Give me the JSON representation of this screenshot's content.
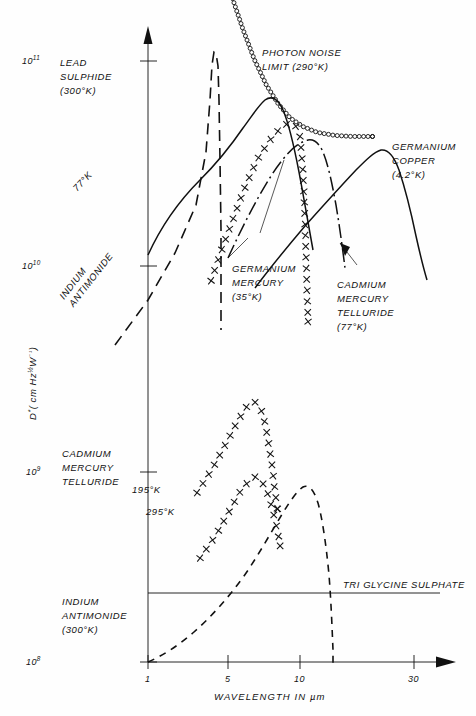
{
  "chart_data": {
    "type": "line",
    "title": "",
    "xlabel": "WAVELENGTH IN µm",
    "ylabel": "D* (cm Hz½ W⁻¹)",
    "xscale": "log",
    "yscale": "log",
    "xlim": [
      1,
      40
    ],
    "ylim": [
      100000000.0,
      200000000000.0
    ],
    "xticks": [
      "1",
      "5",
      "10",
      "30"
    ],
    "xtick_values": [
      1,
      5,
      10,
      30
    ],
    "yticks": [
      "10⁸",
      "10⁹",
      "10¹⁰",
      "10¹¹"
    ],
    "ytick_values": [
      100000000.0,
      1000000000.0,
      10000000000.0,
      100000000000.0
    ],
    "grid": false,
    "legend": "inline-annotations",
    "series": [
      {
        "name": "PHOTON NOISE LIMIT (290°K)",
        "style": "circles-chain",
        "points": [
          [
            3.6,
            205000000000.0
          ],
          [
            4.2,
            145000000000.0
          ],
          [
            5.0,
            102000000000.0
          ],
          [
            6.0,
            76000000000.0
          ],
          [
            7.2,
            61000000000.0
          ],
          [
            8.6,
            52000000000.0
          ],
          [
            10.5,
            47000000000.0
          ],
          [
            13,
            44000000000.0
          ],
          [
            17,
            42500000000.0
          ],
          [
            22,
            42000000000.0
          ],
          [
            30,
            42000000000.0
          ]
        ]
      },
      {
        "name": "LEAD SULPHIDE (300°K)",
        "style": "solid",
        "points": [
          [
            1.0,
            30000000000.0
          ],
          [
            1.3,
            44000000000.0
          ],
          [
            1.7,
            56000000000.0
          ],
          [
            2.1,
            64000000000.0
          ],
          [
            2.5,
            69000000000.0
          ],
          [
            2.8,
            67000000000.0
          ],
          [
            3.1,
            56000000000.0
          ],
          [
            3.4,
            36000000000.0
          ],
          [
            3.7,
            19000000000.0
          ],
          [
            3.9,
            10500000000.0
          ],
          [
            4.05,
            6500000000.0
          ]
        ]
      },
      {
        "name": "INDIUM ANTIMONIDE (77°K)",
        "style": "dashed",
        "points": [
          [
            1.35,
            8000000000.0
          ],
          [
            2.0,
            17000000000.0
          ],
          [
            2.8,
            32000000000.0
          ],
          [
            3.6,
            60000000000.0
          ],
          [
            4.4,
            105000000000.0
          ],
          [
            4.9,
            135000000000.0
          ],
          [
            5.2,
            142000000000.0
          ],
          [
            5.5,
            130000000000.0
          ],
          [
            5.7,
            80000000000.0
          ],
          [
            5.8,
            30000000000.0
          ],
          [
            5.85,
            8000000000.0
          ],
          [
            5.9,
            2300000000.0
          ]
        ]
      },
      {
        "name": "CADMIUM MERCURY TELLURIDE (77°K)",
        "style": "crosses",
        "points": [
          [
            2.6,
            8000000000.0
          ],
          [
            3.0,
            11000000000.0
          ],
          [
            3.6,
            16000000000.0
          ],
          [
            4.3,
            23000000000.0
          ],
          [
            5.2,
            32000000000.0
          ],
          [
            6.3,
            40000000000.0
          ],
          [
            7.4,
            46000000000.0
          ],
          [
            8.4,
            49000000000.0
          ],
          [
            9.3,
            48000000000.0
          ],
          [
            10.0,
            42000000000.0
          ],
          [
            10.4,
            30000000000.0
          ],
          [
            10.7,
            19000000000.0
          ],
          [
            10.9,
            12000000000.0
          ],
          [
            11.1,
            7500000000.0
          ],
          [
            11.3,
            5000000000.0
          ]
        ]
      },
      {
        "name": "GERMANIUM MERCURY (35°K)",
        "style": "dash-dot",
        "points": [
          [
            3.3,
            9500000000.0
          ],
          [
            4.0,
            17000000000.0
          ],
          [
            4.9,
            29000000000.0
          ],
          [
            6.0,
            40000000000.0
          ],
          [
            7.2,
            46000000000.0
          ],
          [
            8.4,
            47000000000.0
          ],
          [
            9.4,
            43000000000.0
          ],
          [
            10.0,
            34000000000.0
          ],
          [
            10.5,
            23000000000.0
          ],
          [
            10.9,
            14000000000.0
          ],
          [
            11.2,
            8000000000.0
          ],
          [
            11.5,
            4600000000.0
          ]
        ]
      },
      {
        "name": "GERMANIUM COPPER (4.2°K)",
        "style": "solid",
        "points": [
          [
            4.0,
            6500000000.0
          ],
          [
            6.0,
            12000000000.0
          ],
          [
            8.5,
            20000000000.0
          ],
          [
            11.0,
            29000000000.0
          ],
          [
            14.0,
            37000000000.0
          ],
          [
            17.0,
            41000000000.0
          ],
          [
            19.5,
            42000000000.0
          ],
          [
            22.0,
            37000000000.0
          ],
          [
            24.0,
            26000000000.0
          ],
          [
            25.5,
            16000000000.0
          ],
          [
            27.0,
            9000000000.0
          ],
          [
            28.0,
            5600000000.0
          ]
        ]
      },
      {
        "name": "CADMIUM MERCURY TELLURIDE 195°K",
        "style": "crosses",
        "points": [
          [
            2.1,
            700000000.0
          ],
          [
            2.6,
            900000000.0
          ],
          [
            3.2,
            1200000000.0
          ],
          [
            3.9,
            1600000000.0
          ],
          [
            4.5,
            1900000000.0
          ],
          [
            5.0,
            2000000000.0
          ],
          [
            5.5,
            1850000000.0
          ],
          [
            5.9,
            1550000000.0
          ],
          [
            6.2,
            1250000000.0
          ],
          [
            6.5,
            1000000000.0
          ],
          [
            6.7,
            820000000.0
          ],
          [
            6.9,
            680000000.0
          ],
          [
            7.1,
            580000000.0
          ]
        ]
      },
      {
        "name": "CADMIUM MERCURY TELLURIDE 295°K",
        "style": "crosses",
        "points": [
          [
            2.2,
            330000000.0
          ],
          [
            2.8,
            430000000.0
          ],
          [
            3.4,
            560000000.0
          ],
          [
            4.0,
            700000000.0
          ],
          [
            4.6,
            800000000.0
          ],
          [
            5.1,
            840000000.0
          ],
          [
            5.6,
            800000000.0
          ],
          [
            6.1,
            700000000.0
          ],
          [
            6.5,
            600000000.0
          ],
          [
            6.9,
            500000000.0
          ],
          [
            7.2,
            430000000.0
          ],
          [
            7.4,
            380000000.0
          ]
        ]
      },
      {
        "name": "INDIUM ANTIMONIDE (300°K)",
        "style": "dashed",
        "points": [
          [
            1.0,
            100000000.0
          ],
          [
            1.5,
            115000000.0
          ],
          [
            2.1,
            150000000.0
          ],
          [
            2.7,
            210000000.0
          ],
          [
            3.3,
            300000000.0
          ],
          [
            3.9,
            430000000.0
          ],
          [
            4.5,
            580000000.0
          ],
          [
            5.0,
            700000000.0
          ],
          [
            5.5,
            780000000.0
          ],
          [
            5.9,
            760000000.0
          ],
          [
            6.2,
            640000000.0
          ],
          [
            6.5,
            400000000.0
          ],
          [
            6.7,
            220000000.0
          ],
          [
            6.85,
            120000000.0
          ],
          [
            6.95,
            80000000.0
          ]
        ]
      },
      {
        "name": "TRI GLYCINE SULPHATE",
        "style": "solid-thin-horizontal",
        "points": [
          [
            1.0,
            330000000.0
          ],
          [
            30,
            330000000.0
          ]
        ]
      }
    ]
  },
  "annotations": {
    "lead_sulphide": {
      "l1": "LEAD",
      "l2": "SULPHIDE",
      "l3": "(300°K)"
    },
    "insb_77k": {
      "l1": "77°K"
    },
    "insb_upper": {
      "l1": "INDIUM",
      "l2": "ANTIMONIDE"
    },
    "photon_noise": {
      "l1": "PHOTON NOISE",
      "l2": "LIMIT (290°K)"
    },
    "germanium_copper": {
      "l1": "GERMANIUM",
      "l2": "COPPER",
      "l3": "(4.2°K)"
    },
    "germanium_mercury": {
      "l1": "GERMANIUM",
      "l2": "MERCURY",
      "l3": "(35°K)"
    },
    "cmt_77k": {
      "l1": "CADMIUM",
      "l2": "MERCURY",
      "l3": "TELLURIDE",
      "l4": "(77°K)"
    },
    "cmt_lower": {
      "l1": "CADMIUM",
      "l2": "MERCURY",
      "l3": "TELLURIDE",
      "t1": "195°K",
      "t2": "295°K"
    },
    "tgs": {
      "l1": "TRI GLYCINE SULPHATE"
    },
    "insb_300k": {
      "l1": "INDIUM",
      "l2": "ANTIMONIDE",
      "l3": "(300°K)"
    }
  },
  "axes": {
    "x_title": "WAVELENGTH   IN   µm",
    "y_title_main": "D",
    "y_title_star": "*",
    "y_title_rest": "( cm Hz",
    "y_title_half": "½",
    "y_title_w": "W",
    "y_title_inv": "⁻¹",
    "y_title_close": ")",
    "xt1": "1",
    "xt5": "5",
    "xt10": "10",
    "xt30": "30",
    "y8_m": "10",
    "y8_e": "8",
    "y9_m": "10",
    "y9_e": "9",
    "y10_m": "10",
    "y10_e": "10",
    "y11_m": "10",
    "y11_e": "11"
  },
  "colors": {
    "ink": "#111111",
    "paper": "#fefefe"
  }
}
